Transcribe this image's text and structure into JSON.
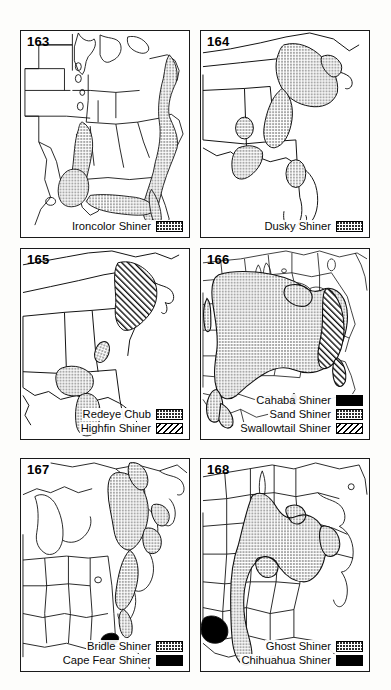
{
  "figure": {
    "kind": "species-distribution-map-plate",
    "panel_count": 6,
    "region": "Eastern and Central United States"
  },
  "patterns": {
    "stipple": "stipple",
    "solid": "solid-black",
    "hatch": "diagonal-hatch"
  },
  "panels": [
    {
      "number": "163",
      "legend": [
        {
          "label": "Ironcolor Shiner",
          "pattern": "stipple"
        }
      ]
    },
    {
      "number": "164",
      "legend": [
        {
          "label": "Dusky Shiner",
          "pattern": "stipple"
        }
      ]
    },
    {
      "number": "165",
      "legend": [
        {
          "label": "Redeye Chub",
          "pattern": "stipple"
        },
        {
          "label": "Highfin Shiner",
          "pattern": "hatch"
        }
      ]
    },
    {
      "number": "166",
      "legend": [
        {
          "label": "Cahaba Shiner",
          "pattern": "solid"
        },
        {
          "label": "Sand Shiner",
          "pattern": "stipple"
        },
        {
          "label": "Swallowtail Shiner",
          "pattern": "hatch"
        }
      ]
    },
    {
      "number": "167",
      "legend": [
        {
          "label": "Bridle Shiner",
          "pattern": "stipple"
        },
        {
          "label": "Cape Fear Shiner",
          "pattern": "solid"
        }
      ]
    },
    {
      "number": "168",
      "legend": [
        {
          "label": "Ghost Shiner",
          "pattern": "stipple"
        },
        {
          "label": "Chihuahua Shiner",
          "pattern": "solid"
        }
      ]
    }
  ],
  "colors": {
    "ink": "#000000",
    "paper": "#ffffff",
    "page": "#fdfdfb"
  }
}
